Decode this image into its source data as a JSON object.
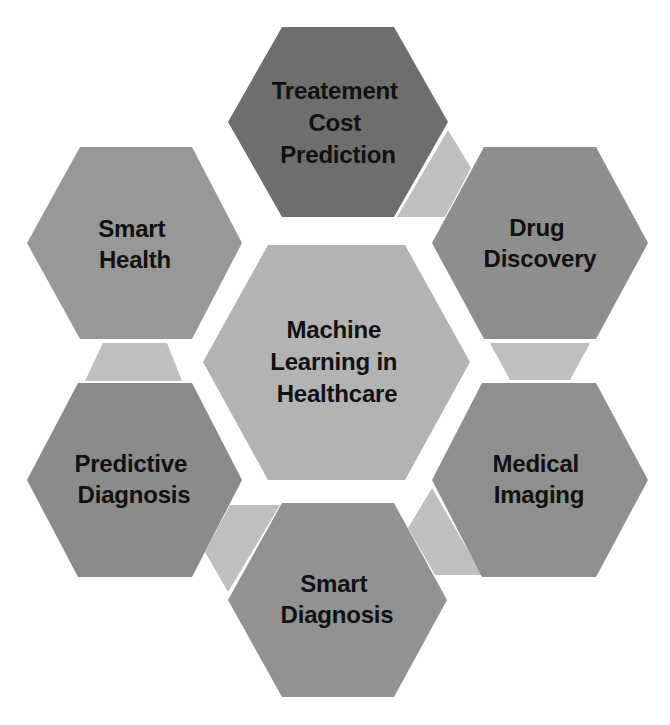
{
  "diagram": {
    "title": "Machine Learning in Healthcare",
    "background_color": "#ffffff",
    "text_color": "#111111",
    "connector_color": "#bfbfbf",
    "center": {
      "lines": [
        "Machine",
        "Learning in",
        "Healthcare"
      ],
      "color": "#b3b3b3"
    },
    "nodes": [
      {
        "id": "treatment-cost-prediction",
        "lines": [
          "Treatement",
          "Cost",
          "Prediction"
        ],
        "color": "#6e6e6e"
      },
      {
        "id": "drug-discovery",
        "lines": [
          "Drug",
          "Discovery"
        ],
        "color": "#8e8e8e"
      },
      {
        "id": "medical-imaging",
        "lines": [
          "Medical",
          "Imaging"
        ],
        "color": "#8f8f8f"
      },
      {
        "id": "smart-diagnosis",
        "lines": [
          "Smart",
          "Diagnosis"
        ],
        "color": "#929292"
      },
      {
        "id": "predictive-diagnosis",
        "lines": [
          "Predictive",
          "Diagnosis"
        ],
        "color": "#8b8b8b"
      },
      {
        "id": "smart-health",
        "lines": [
          "Smart",
          "Health"
        ],
        "color": "#989898"
      }
    ],
    "connectors": [
      {
        "from": "treatment-cost-prediction",
        "to": "drug-discovery"
      },
      {
        "from": "drug-discovery",
        "to": "medical-imaging"
      },
      {
        "from": "medical-imaging",
        "to": "smart-diagnosis"
      },
      {
        "from": "smart-diagnosis",
        "to": "predictive-diagnosis"
      },
      {
        "from": "predictive-diagnosis",
        "to": "smart-health"
      }
    ]
  }
}
